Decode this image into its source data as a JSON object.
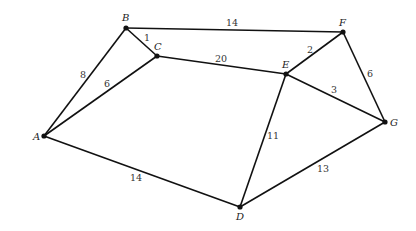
{
  "graph": {
    "type": "weighted-undirected",
    "nodes": [
      {
        "id": "A",
        "label": "A",
        "x": 44,
        "y": 136,
        "lx": 33,
        "ly": 140
      },
      {
        "id": "B",
        "label": "B",
        "x": 126,
        "y": 28,
        "lx": 122,
        "ly": 21
      },
      {
        "id": "C",
        "label": "C",
        "x": 157,
        "y": 56,
        "lx": 154,
        "ly": 50
      },
      {
        "id": "D",
        "label": "D",
        "x": 240,
        "y": 207,
        "lx": 236,
        "ly": 220
      },
      {
        "id": "E",
        "label": "E",
        "x": 286,
        "y": 74,
        "lx": 282,
        "ly": 68
      },
      {
        "id": "F",
        "label": "F",
        "x": 343,
        "y": 32,
        "lx": 339,
        "ly": 26
      },
      {
        "id": "G",
        "label": "G",
        "x": 385,
        "y": 122,
        "lx": 390,
        "ly": 126
      }
    ],
    "edges": [
      {
        "from": "A",
        "to": "B",
        "weight": "8",
        "lx": 80,
        "ly": 78
      },
      {
        "from": "A",
        "to": "C",
        "weight": "6",
        "lx": 104,
        "ly": 87
      },
      {
        "from": "B",
        "to": "C",
        "weight": "1",
        "lx": 144,
        "ly": 41
      },
      {
        "from": "B",
        "to": "F",
        "weight": "14",
        "lx": 226,
        "ly": 26
      },
      {
        "from": "C",
        "to": "E",
        "weight": "20",
        "lx": 215,
        "ly": 62
      },
      {
        "from": "E",
        "to": "F",
        "weight": "2",
        "lx": 307,
        "ly": 53
      },
      {
        "from": "E",
        "to": "G",
        "weight": "3",
        "lx": 331,
        "ly": 93
      },
      {
        "from": "F",
        "to": "G",
        "weight": "6",
        "lx": 367,
        "ly": 77
      },
      {
        "from": "E",
        "to": "D",
        "weight": "11",
        "lx": 267,
        "ly": 139
      },
      {
        "from": "A",
        "to": "D",
        "weight": "14",
        "lx": 130,
        "ly": 181
      },
      {
        "from": "D",
        "to": "G",
        "weight": "13",
        "lx": 317,
        "ly": 172
      }
    ]
  }
}
